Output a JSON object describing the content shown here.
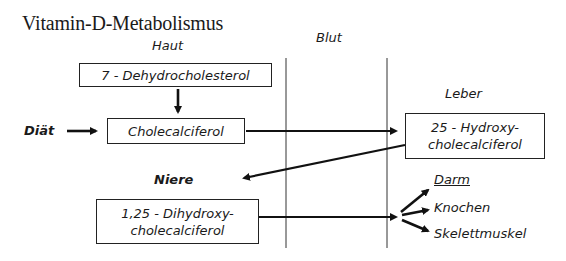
{
  "title": "Vitamin-D-Metabolismus",
  "compartments": {
    "haut": "Haut",
    "blut": "Blut",
    "leber": "Leber",
    "niere": "Niere"
  },
  "inputs": {
    "diaet": "Diät"
  },
  "nodes": {
    "dehydro": "7 - Dehydrocholesterol",
    "chole": "Cholecalciferol",
    "hydroxy_line1": "25 - Hydroxy-",
    "hydroxy_line2": "cholecalciferol",
    "dihydroxy_line1": "1,25 - Dihydroxy-",
    "dihydroxy_line2": "cholecalciferol"
  },
  "targets": {
    "darm": "Darm",
    "knochen": "Knochen",
    "skelettmuskel": "Skelettmuskel"
  },
  "edges": [
    {
      "from": "7 - Dehydrocholesterol",
      "to": "Cholecalciferol"
    },
    {
      "from": "Diät",
      "to": "Cholecalciferol"
    },
    {
      "from": "Cholecalciferol",
      "to": "25 - Hydroxy-cholecalciferol"
    },
    {
      "from": "25 - Hydroxy-cholecalciferol",
      "to": "Niere"
    },
    {
      "from": "1,25 - Dihydroxy-cholecalciferol",
      "to": "Darm"
    },
    {
      "from": "1,25 - Dihydroxy-cholecalciferol",
      "to": "Knochen"
    },
    {
      "from": "1,25 - Dihydroxy-cholecalciferol",
      "to": "Skelettmuskel"
    }
  ]
}
